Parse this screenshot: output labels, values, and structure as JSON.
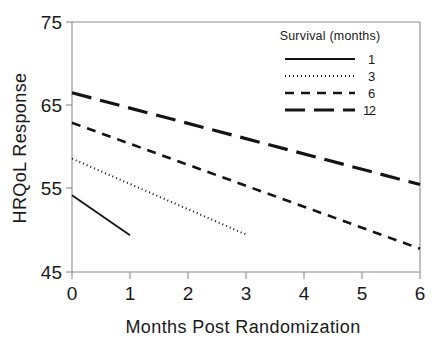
{
  "chart_data": {
    "type": "line",
    "title": "",
    "xlabel": "Months Post Randomization",
    "ylabel": "HRQoL Response",
    "xlim": [
      0,
      6
    ],
    "ylim": [
      45,
      75
    ],
    "xticks": [
      "0",
      "1",
      "2",
      "3",
      "4",
      "5",
      "6"
    ],
    "yticks": [
      "45",
      "55",
      "65",
      "75"
    ],
    "grid": false,
    "legend_position": "top-right",
    "legend_title": "Survival  (months)",
    "series": [
      {
        "name": "1",
        "label": "1",
        "style": "solid",
        "x": [
          0,
          1
        ],
        "y": [
          54.2,
          49.4
        ]
      },
      {
        "name": "3",
        "label": "3",
        "style": "dotted",
        "x": [
          0,
          3
        ],
        "y": [
          58.6,
          49.5
        ]
      },
      {
        "name": "6",
        "label": "6",
        "style": "dashed",
        "x": [
          0,
          6
        ],
        "y": [
          62.9,
          47.8
        ]
      },
      {
        "name": "12",
        "label": "12",
        "style": "long-dash",
        "x": [
          0,
          6
        ],
        "y": [
          66.5,
          55.5
        ]
      }
    ]
  },
  "colors": {
    "line": "#141414",
    "axis": "#8c8c8c",
    "text": "#1a1a1a",
    "background": "#ffffff"
  }
}
